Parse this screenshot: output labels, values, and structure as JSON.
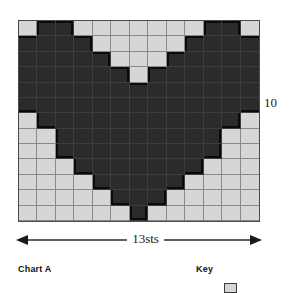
{
  "figure": {
    "title": "Chart A",
    "key_title": "Key",
    "width_label": "13sts",
    "row_label": "10"
  },
  "colors": {
    "dark_stitch": "#2b2b2b",
    "light_stitch": "#d6d6d6",
    "grid_line": "#8a8a8a",
    "outline": "#0a0a0a",
    "frame": "#4a4a4a"
  },
  "chart_data": {
    "type": "heatmap",
    "title": "Chart A",
    "xlabel": "13sts",
    "ylabel": "",
    "columns": 13,
    "rows": 13,
    "legend_position": "bottom-right",
    "grid": true,
    "x": [
      1,
      2,
      3,
      4,
      5,
      6,
      7,
      8,
      9,
      10,
      11,
      12,
      13
    ],
    "row_tick_labels": [
      "10"
    ],
    "value_map": {
      "0": "light_stitch",
      "1": "dark_stitch"
    },
    "categories": [
      "light",
      "dark"
    ],
    "rows_top_to_bottom": [
      {
        "row": 13,
        "values": [
          0,
          1,
          1,
          0,
          0,
          0,
          0,
          0,
          0,
          0,
          1,
          1,
          0
        ]
      },
      {
        "row": 12,
        "values": [
          1,
          1,
          1,
          1,
          0,
          0,
          0,
          0,
          0,
          1,
          1,
          1,
          1
        ]
      },
      {
        "row": 11,
        "values": [
          1,
          1,
          1,
          1,
          1,
          0,
          0,
          0,
          1,
          1,
          1,
          1,
          1
        ]
      },
      {
        "row": 10,
        "values": [
          1,
          1,
          1,
          1,
          1,
          1,
          0,
          1,
          1,
          1,
          1,
          1,
          1
        ]
      },
      {
        "row": 9,
        "values": [
          1,
          1,
          1,
          1,
          1,
          1,
          1,
          1,
          1,
          1,
          1,
          1,
          1
        ]
      },
      {
        "row": 8,
        "values": [
          1,
          1,
          1,
          1,
          1,
          1,
          1,
          1,
          1,
          1,
          1,
          1,
          1
        ]
      },
      {
        "row": 7,
        "values": [
          0,
          1,
          1,
          1,
          1,
          1,
          1,
          1,
          1,
          1,
          1,
          1,
          0
        ]
      },
      {
        "row": 6,
        "values": [
          0,
          0,
          1,
          1,
          1,
          1,
          1,
          1,
          1,
          1,
          1,
          0,
          0
        ]
      },
      {
        "row": 5,
        "values": [
          0,
          0,
          1,
          1,
          1,
          1,
          1,
          1,
          1,
          1,
          1,
          0,
          0
        ]
      },
      {
        "row": 4,
        "values": [
          0,
          0,
          0,
          1,
          1,
          1,
          1,
          1,
          1,
          1,
          0,
          0,
          0
        ]
      },
      {
        "row": 3,
        "values": [
          0,
          0,
          0,
          0,
          1,
          1,
          1,
          1,
          1,
          0,
          0,
          0,
          0
        ]
      },
      {
        "row": 2,
        "values": [
          0,
          0,
          0,
          0,
          0,
          1,
          1,
          1,
          0,
          0,
          0,
          0,
          0
        ]
      },
      {
        "row": 1,
        "values": [
          0,
          0,
          0,
          0,
          0,
          0,
          1,
          0,
          0,
          0,
          0,
          0,
          0
        ]
      }
    ],
    "legend": [
      {
        "label": "",
        "swatch": "light_stitch"
      }
    ]
  }
}
